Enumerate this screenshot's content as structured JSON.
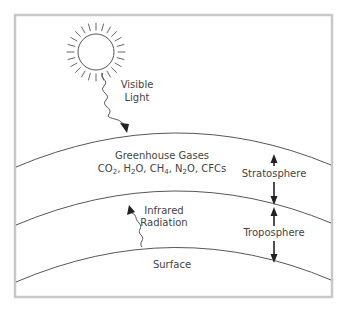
{
  "diagram": {
    "labels": {
      "visible_light_line1": "Visible",
      "visible_light_line2": "Light",
      "greenhouse_gases": "Greenhouse Gases",
      "gases_list": {
        "co2_main": "CO",
        "co2_sub": "2",
        "sep1": ", H",
        "h2o_sub": "2",
        "h2o_rest": "O, CH",
        "ch4_sub": "4",
        "sep2": ", N",
        "n2o_sub": "2",
        "n2o_rest": "O, CFCs"
      },
      "stratosphere": "Stratosphere",
      "troposphere": "Troposphere",
      "infrared_line1": "Infrared",
      "infrared_line2": "Radiation",
      "surface": "Surface"
    },
    "layers": [
      {
        "name": "top-of-stratosphere",
        "left_y": 167,
        "peak_y": 134,
        "right_y": 165
      },
      {
        "name": "tropopause",
        "left_y": 225,
        "peak_y": 192,
        "right_y": 223
      },
      {
        "name": "surface",
        "left_y": 282,
        "peak_y": 248,
        "right_y": 280
      }
    ],
    "icons": {
      "sun": "sun-icon",
      "visible_light_arrow": "wavy-arrow-down-icon",
      "infrared_arrow": "wavy-arrow-up-icon",
      "stratosphere_arrows": "double-arrow-vertical-icon",
      "troposphere_arrows": "double-arrow-vertical-icon"
    },
    "colors": {
      "line": "#444444",
      "frame": "#c8c8c8",
      "text": "#444444",
      "arrow": "#222222"
    }
  }
}
